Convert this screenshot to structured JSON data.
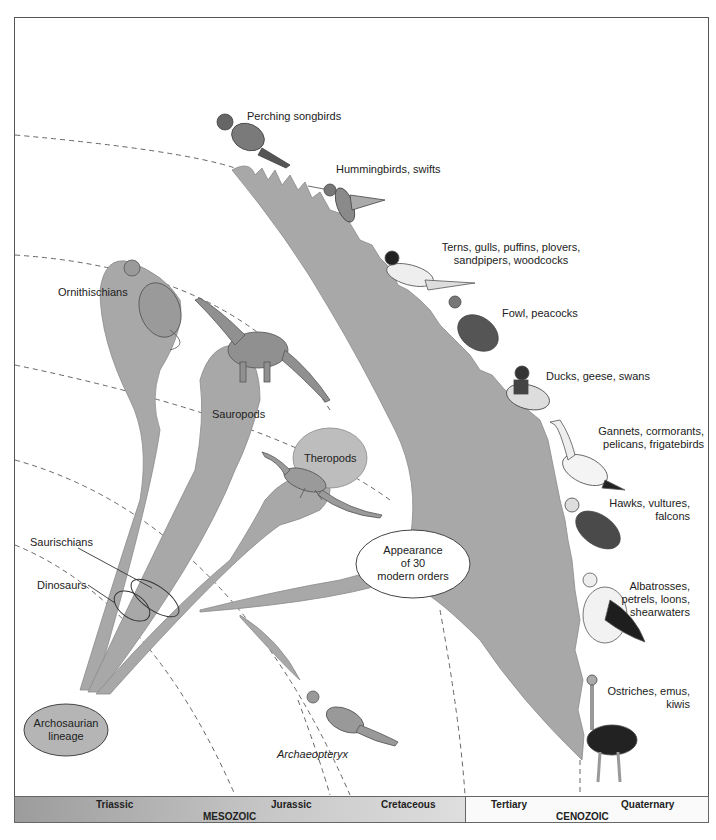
{
  "diagram": {
    "type": "phylogenetic-tree",
    "fill_color": "#a8a8a8",
    "line_color": "#555555"
  },
  "root": {
    "label": "Archosaurian lineage",
    "line1": "Archosaurian",
    "line2": "lineage"
  },
  "clades": {
    "saurischians": "Saurischians",
    "dinosaurs": "Dinosaurs",
    "ornithischians": "Ornithischians",
    "sauropods": "Sauropods",
    "theropods": "Theropods",
    "archaeopteryx": "Archaeopteryx"
  },
  "callout": {
    "line1": "Appearance",
    "line2": "of 30",
    "line3": "modern orders"
  },
  "bird_groups": [
    {
      "line1": "Perching songbirds",
      "line2": ""
    },
    {
      "line1": "Hummingbirds, swifts",
      "line2": ""
    },
    {
      "line1": "Terns, gulls, puffins, plovers,",
      "line2": "sandpipers, woodcocks"
    },
    {
      "line1": "Fowl, peacocks",
      "line2": ""
    },
    {
      "line1": "Ducks, geese, swans",
      "line2": ""
    },
    {
      "line1": "Gannets, cormorants,",
      "line2": "pelicans, frigatebirds"
    },
    {
      "line1": "Hawks, vultures,",
      "line2": "falcons"
    },
    {
      "line1": "Albatrosses,",
      "line2": "petrels, loons,",
      "line3": "shearwaters"
    },
    {
      "line1": "Ostriches, emus,",
      "line2": "kiwis"
    }
  ],
  "timeline": {
    "eras": [
      {
        "name": "MESOZOIC",
        "periods": [
          "Triassic",
          "Jurassic",
          "Cretaceous"
        ]
      },
      {
        "name": "CENOZOIC",
        "periods": [
          "Tertiary",
          "Quaternary"
        ]
      }
    ]
  }
}
